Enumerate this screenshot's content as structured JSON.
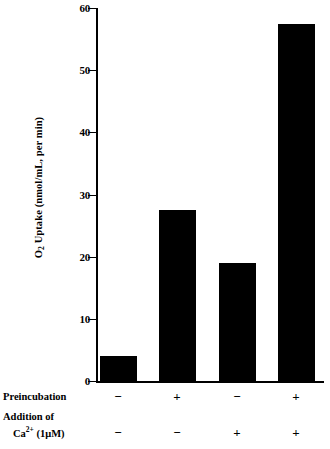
{
  "chart_data": {
    "type": "bar",
    "title": "",
    "xlabel": "",
    "ylabel": "O2 Uptake (nmol/mL, per min)",
    "ylabel_parts": {
      "pre": "O",
      "sub": "2",
      "post": " Uptake (nmol/mL, per min)"
    },
    "ylim": [
      0,
      60
    ],
    "yticks": [
      0,
      10,
      20,
      30,
      40,
      50,
      60
    ],
    "ytick_labels": [
      "0",
      "10",
      "20",
      "30",
      "40",
      "50",
      "60"
    ],
    "grid": false,
    "legend": "none",
    "bar_color": "#000000",
    "categories": [
      "1",
      "2",
      "3",
      "4"
    ],
    "values": [
      4.0,
      27.5,
      19.0,
      57.5
    ],
    "condition_rows": [
      {
        "label": "Preincubation",
        "label_line1": "Preincubation",
        "label_line2": "",
        "values": [
          "−",
          "+",
          "−",
          "+"
        ]
      },
      {
        "label": "Addition of Ca2+ (1μM)",
        "label_line1": "Addition of",
        "label_line2": "Ca",
        "label_line2_sup": "2+",
        "label_line2_rest": " (1μM)",
        "values": [
          "−",
          "−",
          "+",
          "+"
        ]
      }
    ]
  }
}
